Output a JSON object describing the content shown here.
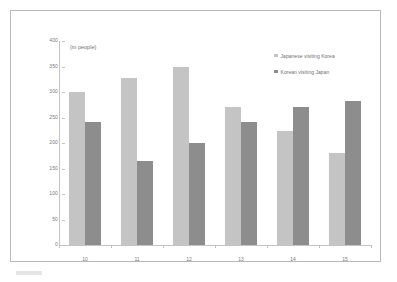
{
  "chart_data": {
    "type": "bar",
    "title": "",
    "subtitle": "",
    "axis_unit_caption": "(m people)",
    "xlabel": "",
    "ylabel": "",
    "categories": [
      "10",
      "11",
      "12",
      "13",
      "14",
      "15"
    ],
    "series": [
      {
        "name": "Japanese visiting Korea",
        "color": "#c4c4c4",
        "values": [
          301,
          328,
          350,
          271,
          224,
          181
        ]
      },
      {
        "name": "Korean visiting Japan",
        "color": "#8d8d8d",
        "values": [
          242,
          164,
          201,
          242,
          271,
          282
        ]
      }
    ],
    "ylim": [
      0,
      400
    ],
    "yticks": [
      0,
      50,
      100,
      150,
      200,
      250,
      300,
      350,
      400
    ],
    "ytick_labels": [
      "0",
      "50",
      "100",
      "150",
      "200",
      "250",
      "300",
      "350",
      "400"
    ],
    "grid": false,
    "legend_position": "top-right"
  },
  "legend": {
    "items": [
      {
        "label": "Japanese visiting Korea",
        "swatch": "series-a"
      },
      {
        "label": "Korean visiting Japan",
        "swatch": "series-b"
      }
    ]
  },
  "colors": {
    "series_a": "#c4c4c4",
    "series_b": "#8d8d8d",
    "axis": "#c3c3c3",
    "frame": "#b9b9b9",
    "text": "#7a7a7a",
    "background": "#ffffff"
  }
}
